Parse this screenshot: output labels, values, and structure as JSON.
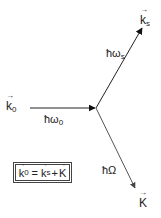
{
  "diagram": {
    "labels": {
      "k0": {
        "base": "k",
        "sub": "0"
      },
      "ks": {
        "base": "k",
        "sub": "s"
      },
      "K": {
        "base": "K",
        "sub": ""
      },
      "omega0": {
        "base": "ħω",
        "sub": "0"
      },
      "omegas": {
        "base": "ħω",
        "sub": "s"
      },
      "Omega": {
        "base": "ħΩ",
        "sub": ""
      }
    },
    "equation": {
      "lhs": {
        "base": "k",
        "sub": "0"
      },
      "eq": "=",
      "t1": {
        "base": "k",
        "sub": "s"
      },
      "plus": "+",
      "t2": {
        "base": "K"
      }
    },
    "arrows": [
      {
        "name": "k0",
        "from": [
          30,
          108
        ],
        "to": [
          96,
          108
        ],
        "color": "#222222"
      },
      {
        "name": "ks",
        "from": [
          96,
          108
        ],
        "to": [
          143,
          27
        ],
        "color": "#222222"
      },
      {
        "name": "K",
        "from": [
          96,
          108
        ],
        "to": [
          136,
          189
        ],
        "color": "#555555"
      }
    ]
  }
}
